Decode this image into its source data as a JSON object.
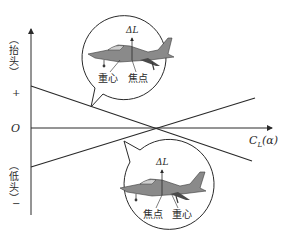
{
  "axes": {
    "origin_label": "O",
    "x_label_main": "C",
    "x_label_sub": "L",
    "x_label_arg": "(α)",
    "y_positive_label": "（抬头）",
    "y_positive_sign": "+",
    "y_negative_label": "（低头）",
    "y_negative_sign": "−"
  },
  "callout_top": {
    "lift_label": "ΔL",
    "cg_label": "重心",
    "focus_label": "焦点"
  },
  "callout_bottom": {
    "lift_label": "ΔL",
    "focus_label": "焦点",
    "cg_label": "重心"
  },
  "lines": [
    {
      "name": "descending-line",
      "from": [
        31,
        86
      ],
      "to": [
        252,
        161
      ]
    },
    {
      "name": "ascending-line",
      "from": [
        31,
        167
      ],
      "to": [
        255,
        98
      ]
    }
  ],
  "colors": {
    "line": "#2a2a2a",
    "plane_body": "#7a7a7a",
    "plane_dark": "#3a3a3a"
  }
}
